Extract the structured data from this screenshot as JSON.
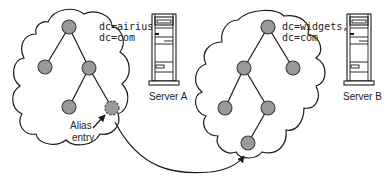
{
  "diagram": {
    "title": "",
    "left_tree": {
      "label_line1": "dc=airius,",
      "label_line2": "dc=com",
      "server_label": "Server A",
      "alias_label_line1": "Alias",
      "alias_label_line2": "entry"
    },
    "right_tree": {
      "label_line1": "dc=widgets,",
      "label_line2": "dc=com",
      "server_label": "Server B"
    },
    "colors": {
      "node_fill": "#9a9a9a",
      "node_stroke": "#3a3a3a",
      "line": "#1a1a1a",
      "background": "#ffffff"
    }
  }
}
